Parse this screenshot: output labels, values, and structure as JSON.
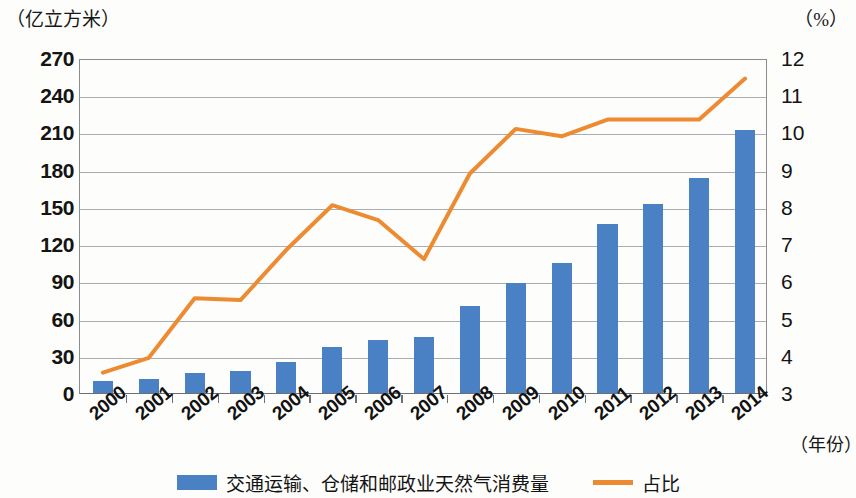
{
  "units": {
    "left": "（亿立方米）",
    "right": "（%）",
    "x": "（年份）"
  },
  "legend": [
    {
      "label": "交通运输、仓储和邮政业天然气消费量",
      "type": "bar",
      "color": "#4a81c4"
    },
    {
      "label": "占比",
      "type": "line",
      "color": "#ed8b33"
    }
  ],
  "chart_data": {
    "type": "bar",
    "title": "",
    "subtitle": "",
    "xlabel": "（年份）",
    "ylabel": "（亿立方米）",
    "y2label": "（%）",
    "grid": true,
    "legend_position": "bottom",
    "categories": [
      "2000",
      "2001",
      "2002",
      "2003",
      "2004",
      "2005",
      "2006",
      "2007",
      "2008",
      "2009",
      "2010",
      "2011",
      "2012",
      "2013",
      "2014"
    ],
    "ylim": [
      0,
      270
    ],
    "yticks": [
      0,
      30,
      60,
      90,
      120,
      150,
      180,
      210,
      240,
      270
    ],
    "y2lim": [
      3,
      12
    ],
    "y2ticks": [
      3,
      4,
      5,
      6,
      7,
      8,
      9,
      10,
      11,
      12
    ],
    "series": [
      {
        "name": "交通运输、仓储和邮政业天然气消费量",
        "type": "bar",
        "axis": "left",
        "color": "#4a81c4",
        "values": [
          10,
          11,
          16,
          18,
          25,
          37,
          43,
          45,
          70,
          89,
          105,
          136,
          152,
          173,
          212
        ]
      },
      {
        "name": "占比",
        "type": "line",
        "axis": "right",
        "color": "#ed8b33",
        "values": [
          3.6,
          4.0,
          5.6,
          5.55,
          6.9,
          8.1,
          7.7,
          6.65,
          8.95,
          10.15,
          9.95,
          10.4,
          10.4,
          10.4,
          11.5
        ]
      }
    ]
  }
}
